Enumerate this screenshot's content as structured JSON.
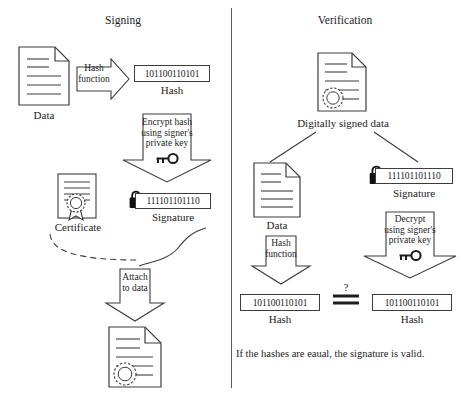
{
  "diagram": {
    "title_left": "Signing",
    "title_right": "Verification",
    "caption": "If the hashes are eaual, the signature is valid."
  },
  "signing": {
    "data_label": "Data",
    "hash_function_line1": "Hash",
    "hash_function_line2": "function",
    "hash_value": "101100110101",
    "hash_label": "Hash",
    "encrypt_line1": "Encrypt hash",
    "encrypt_line2": "using signer's",
    "encrypt_line3": "private key",
    "key_icon": "key-icon",
    "certificate_label": "Certificate",
    "signature_value": "111101101110",
    "signature_label": "Signature",
    "lock_icon": "padlock-icon",
    "attach_line1": "Attach",
    "attach_line2": "to data",
    "document_icon": "document-icon",
    "signed_document_icon": "signed-document-icon",
    "certificate_icon": "certificate-icon"
  },
  "verification": {
    "signed_data_label": "Digitally signed data",
    "signed_data_icon": "signed-document-icon",
    "data_label": "Data",
    "data_icon": "document-icon",
    "signature_value": "111101101110",
    "signature_label": "Signature",
    "lock_icon": "padlock-icon",
    "hash_function_line1": "Hash",
    "hash_function_line2": "function",
    "decrypt_line1": "Decrypt",
    "decrypt_line2": "using signer's",
    "decrypt_line3": "private key",
    "key_icon": "key-icon",
    "hash_left_value": "101100110101",
    "hash_left_label": "Hash",
    "hash_right_value": "101100110101",
    "hash_right_label": "Hash",
    "compare_question": "?"
  },
  "colors": {
    "stroke": "#3c3c3c",
    "text": "#1d1d1d",
    "background": "#ffffff"
  }
}
